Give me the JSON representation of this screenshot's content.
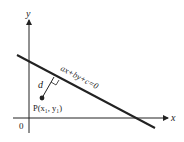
{
  "diagram": {
    "type": "point-to-line distance",
    "axes": {
      "x_label": "x",
      "y_label": "y",
      "origin_label": "0"
    },
    "line": {
      "equation": "ax+by+c=0"
    },
    "point": {
      "label": "P(x₁, y₁)"
    },
    "distance": {
      "label": "d"
    },
    "colors": {
      "ink": "#222222",
      "background": "#ffffff"
    }
  }
}
